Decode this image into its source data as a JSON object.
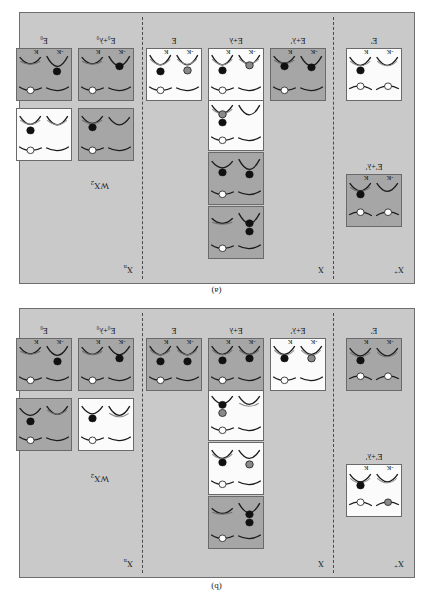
{
  "figure": {
    "material": "WX",
    "material_sub": "2",
    "panels": [
      {
        "id": "b",
        "caption": "(b)",
        "groups": [
          {
            "name": "X+",
            "label_main": "X",
            "label_sup": "+"
          },
          {
            "name": "X",
            "label_main": "X",
            "label_sup": ""
          },
          {
            "name": "X-",
            "label_main": "X",
            "label_sub": "n"
          }
        ],
        "material_label": "WX2"
      },
      {
        "id": "a",
        "caption": "(a)",
        "groups": [
          {
            "name": "X+",
            "label_main": "X",
            "label_sup": "+"
          },
          {
            "name": "X",
            "label_main": "X",
            "label_sup": ""
          },
          {
            "name": "X-",
            "label_main": "X",
            "label_sub": "n"
          }
        ],
        "material_label": "WX2"
      }
    ],
    "valley_labels": {
      "left": "-K",
      "right": "K"
    },
    "energy_labels": {
      "E": "E",
      "E_plus_lambda": "E+λ",
      "E_plus_lambda_prime": "E+λ′",
      "E_prime_plus_lambda_prime": "E′+λ′",
      "E_0": "E",
      "E_0_sub": "0",
      "E_0_plus_lambda_0": "E",
      "E_0_plus_lambda_0_sub": "0"
    },
    "legend_semantics": {
      "open_circle": "hole",
      "filled_black_circle": "electron-spin-down",
      "filled_gray_circle": "electron-spin-up"
    }
  },
  "panel_b": {
    "caption": "(b)",
    "group_labels": [
      {
        "text": "X",
        "sup": "+"
      },
      {
        "text": "X",
        "sup": ""
      },
      {
        "text": "X",
        "sub": "n"
      }
    ],
    "material": {
      "text": "WX",
      "sub": "2"
    },
    "cells": [
      {
        "id": "b-left-top",
        "shade": "light",
        "col_label": "E′+λ′",
        "show_k": false
      },
      {
        "id": "b-left-bottom",
        "shade": "dark",
        "col_label": "E′",
        "show_k": true
      },
      {
        "id": "b-mid-c1",
        "shade": "light",
        "col_label": "E+λ′",
        "show_k": true
      },
      {
        "id": "b-mid-c2-stack3",
        "shade": "dark",
        "col_label": "",
        "show_k": false
      },
      {
        "id": "b-mid-c2-stack2",
        "shade": "light",
        "col_label": "",
        "show_k": false
      },
      {
        "id": "b-mid-c2-stack1",
        "shade": "light",
        "col_label": "",
        "show_k": false
      },
      {
        "id": "b-mid-c2-bottom",
        "shade": "dark",
        "col_label": "E+λ",
        "show_k": true
      },
      {
        "id": "b-mid-c3",
        "shade": "dark",
        "col_label": "E",
        "show_k": true
      },
      {
        "id": "b-right-tl",
        "shade": "light",
        "col_label": "",
        "show_k": false
      },
      {
        "id": "b-right-tr",
        "shade": "dark",
        "col_label": "",
        "show_k": false
      },
      {
        "id": "b-right-bl",
        "shade": "dark",
        "col_label": "E₀+λ₀",
        "show_k": true
      },
      {
        "id": "b-right-br",
        "shade": "dark",
        "col_label": "E₀",
        "show_k": true
      }
    ],
    "column_labels": [
      {
        "key": "col-b-1",
        "text": "E′"
      },
      {
        "key": "col-b-2",
        "text": "E+λ′"
      },
      {
        "key": "col-b-3",
        "text": "E+λ"
      },
      {
        "key": "col-b-4",
        "text": "E"
      },
      {
        "key": "col-b-5",
        "text": "E₀+λ₀"
      },
      {
        "key": "col-b-6",
        "text": "E₀"
      },
      {
        "key": "col-b-left-upper",
        "text": "E′+λ′"
      }
    ]
  },
  "panel_a": {
    "caption": "(a)",
    "group_labels": [
      {
        "text": "X",
        "sup": "+"
      },
      {
        "text": "X",
        "sup": ""
      },
      {
        "text": "X",
        "sub": "n"
      }
    ],
    "material": {
      "text": "WX",
      "sub": "2"
    },
    "column_labels": [
      {
        "key": "col-a-1",
        "text": "E′"
      },
      {
        "key": "col-a-2",
        "text": "E+λ′"
      },
      {
        "key": "col-a-3",
        "text": "E+λ"
      },
      {
        "key": "col-a-4",
        "text": "E"
      },
      {
        "key": "col-a-5",
        "text": "E₀+λ₀"
      },
      {
        "key": "col-a-6",
        "text": "E₀"
      },
      {
        "key": "col-a-left-upper",
        "text": "E′+λ′"
      }
    ]
  },
  "labels": {
    "k_minus": "-K",
    "k_plus": "K",
    "cap_b": "(b)",
    "cap_a": "(a)",
    "x_plus": "X",
    "x_plus_sup": "+",
    "x_neutral": "X",
    "x_minus": "X",
    "x_minus_sub": "n",
    "wx2": "WX",
    "wx2_sub": "2",
    "E": "E",
    "Eprime": "E′",
    "Eprime_lambda_prime": "E′+λ′",
    "E_lambda_prime": "E+λ′",
    "E_lambda": "E+λ",
    "E0": "E",
    "E0_sub": "0",
    "E0_lambda0": "E",
    "E0_lambda0_sub": "0",
    "lambda0": "+λ",
    "lambda0_sub": "0"
  },
  "colors": {
    "panel_bg": "#c9c9c9",
    "cell_light": "#fbfbfb",
    "cell_dark": "#a6a6a6",
    "band_dark": "#1a1a1a",
    "band_light": "#8c8c8c",
    "electron": "#111111",
    "electron_gray": "#8a8a8a",
    "hole": "#ffffff",
    "border": "#6a6a6a",
    "dash": "#4a4a4a"
  }
}
